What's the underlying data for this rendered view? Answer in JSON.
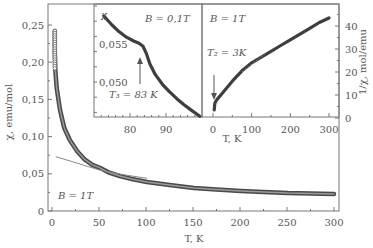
{
  "chart_data": [
    {
      "id": "main",
      "type": "line",
      "title": "",
      "xlabel": "T, K",
      "ylabel": "χ, emu/mol",
      "xlim": [
        -5,
        305
      ],
      "ylim": [
        0,
        0.275
      ],
      "xticks": [
        0,
        50,
        100,
        150,
        200,
        250,
        300
      ],
      "xtick_labels": [
        "0",
        "50",
        "100",
        "150",
        "200",
        "250",
        "300"
      ],
      "yticks": [
        0,
        0.05,
        0.1,
        0.15,
        0.2,
        0.25
      ],
      "ytick_labels": [
        "0",
        "0,05",
        "0,10",
        "0,15",
        "0,20",
        "0,25"
      ],
      "grid": false,
      "annotations": [
        {
          "text": "B = 1 T",
          "x": 5,
          "y": 0.025
        }
      ],
      "series": [
        {
          "name": "χ(T) data, B = 1 T",
          "style": "thick-markers",
          "color": "#555555",
          "x": [
            3,
            3,
            3.5,
            5,
            8.5,
            13,
            19,
            27,
            35,
            43,
            51,
            60,
            72,
            85,
            101,
            125,
            151,
            175,
            201,
            225,
            251,
            275,
            300
          ],
          "y": [
            0.242,
            0.215,
            0.19,
            0.165,
            0.136,
            0.112,
            0.095,
            0.08,
            0.069,
            0.062,
            0.058,
            0.052,
            0.047,
            0.043,
            0.039,
            0.035,
            0.031,
            0.029,
            0.027,
            0.0255,
            0.024,
            0.0235,
            0.023
          ]
        },
        {
          "name": "Curie-Weiss fit",
          "style": "thin-line",
          "color": "#888888",
          "x": [
            4,
            20,
            35,
            51,
            70,
            85,
            101
          ],
          "y": [
            0.073,
            0.067,
            0.061,
            0.055,
            0.05,
            0.047,
            0.044
          ]
        }
      ]
    },
    {
      "id": "inset-left",
      "type": "line",
      "title": "",
      "xlabel": "",
      "ylabel": "χ",
      "xlim": [
        70,
        100
      ],
      "ylim": [
        0.0445,
        0.0605
      ],
      "xticks": [
        80,
        90
      ],
      "xtick_labels": [
        "80",
        "90"
      ],
      "yticks": [
        0.05,
        0.055
      ],
      "ytick_labels": [
        "0,050",
        "0,055"
      ],
      "grid": false,
      "annotations": [
        {
          "text": "B = 0,1 T"
        },
        {
          "text": "T₃ = 83 K",
          "arrow_to": {
            "x": 83.5,
            "y": 0.0545
          }
        }
      ],
      "series": [
        {
          "name": "χ(T), B = 0.1 T",
          "color": "#444444",
          "x": [
            72.7,
            75,
            77,
            79,
            81,
            82.5,
            83.6,
            84.5,
            85.5,
            87,
            89,
            91,
            93,
            95,
            97,
            99.4
          ],
          "y": [
            0.0587,
            0.0575,
            0.0566,
            0.0559,
            0.0554,
            0.0551,
            0.0547,
            0.0538,
            0.0524,
            0.051,
            0.0497,
            0.0487,
            0.0478,
            0.047,
            0.0463,
            0.0455
          ]
        }
      ]
    },
    {
      "id": "inset-right",
      "type": "line",
      "title": "",
      "xlabel": "T, K",
      "ylabel": "1/χ, mol/emu",
      "xlim": [
        -10,
        310
      ],
      "ylim": [
        0,
        46
      ],
      "xticks": [
        0,
        100,
        200,
        300
      ],
      "xtick_labels": [
        "0",
        "100",
        "200",
        "300"
      ],
      "yticks": [
        0,
        10,
        20,
        30,
        40
      ],
      "ytick_labels": [
        "0",
        "10",
        "20",
        "30",
        "40"
      ],
      "grid": false,
      "annotations": [
        {
          "text": "B = 1 T"
        },
        {
          "text": "T₂ = 3 K",
          "arrow_to": {
            "x": 3,
            "y": 6
          }
        }
      ],
      "series": [
        {
          "name": "1/χ(T), B = 1 T",
          "color": "#555555",
          "x": [
            3,
            5,
            10,
            25,
            50,
            75,
            100,
            125,
            150,
            175,
            200,
            225,
            250,
            275,
            300
          ],
          "y": [
            3.5,
            6.5,
            8,
            11,
            16,
            20.5,
            24,
            26.5,
            29,
            31.5,
            34,
            36.5,
            39,
            41.5,
            43.5
          ]
        },
        {
          "name": "linear guide (dashed)",
          "style": "dashed",
          "color": "#888888",
          "x": [
            75,
            135
          ],
          "y": [
            20,
            28
          ]
        }
      ]
    }
  ],
  "labels": {
    "main_xlabel": "T, K",
    "main_ylabel": "χ, emu/mol",
    "main_field": "B = 1T",
    "inset_left_ylabel": "χ",
    "inset_left_field": "B = 0,1T",
    "inset_left_transition": "T₃ = 83 K",
    "inset_right_field": "B = 1T",
    "inset_right_transition": "T₂ = 3K",
    "inset_xlabel": "T, K",
    "right_ylabel": "1/χ, mol/emu"
  }
}
